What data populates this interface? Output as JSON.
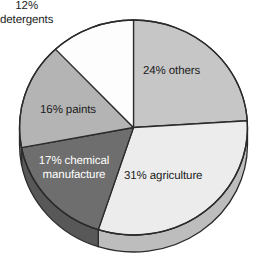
{
  "chart_data": {
    "type": "pie",
    "title": "",
    "subtitle": "",
    "xlabel": "",
    "ylabel": "",
    "legend_position": "none",
    "grid": false,
    "labels_inside": true,
    "total": 100,
    "unit": "%",
    "categories": [
      "others",
      "agriculture",
      "chemical manufacture",
      "paints",
      "detergents"
    ],
    "values": [
      24,
      31,
      17,
      16,
      12
    ],
    "slices": [
      {
        "name": "others",
        "value": 24,
        "label": "24% others",
        "color": "#c6c6c6",
        "text_color": "#1c1c1c",
        "start_angle": 0,
        "end_angle": 86.4
      },
      {
        "name": "agriculture",
        "value": 31,
        "label": "31% agriculture",
        "color": "#ececec",
        "text_color": "#1c1c1c",
        "start_angle": 86.4,
        "end_angle": 198
      },
      {
        "name": "chemical manufacture",
        "value": 17,
        "label": "17% chemical\nmanufacture",
        "color": "#6e6e6e",
        "text_color": "#ffffff",
        "start_angle": 198,
        "end_angle": 259.2
      },
      {
        "name": "paints",
        "value": 16,
        "label": "16% paints",
        "color": "#b4b4b4",
        "text_color": "#1c1c1c",
        "start_angle": 259.2,
        "end_angle": 316.8
      },
      {
        "name": "detergents",
        "value": 12,
        "label": "12%\ndetergents",
        "color": "#fdfdfd",
        "text_color": "#1c1c1c",
        "start_angle": 316.8,
        "end_angle": 360
      }
    ],
    "style": {
      "three_d": true,
      "depth_px": 17,
      "outline_color": "#2b2b2b",
      "background": "#ffffff"
    }
  }
}
